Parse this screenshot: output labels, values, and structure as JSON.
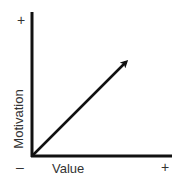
{
  "diagram": {
    "type": "axes-with-vector",
    "y_axis": {
      "label": "Motivation",
      "positive_sign": "+",
      "negative_sign": "–"
    },
    "x_axis": {
      "label": "Value",
      "positive_sign": "+"
    },
    "vector": {
      "from": "origin",
      "direction": "up-right",
      "meaning": "increase in value increases motivation"
    },
    "colors": {
      "axis": "#111111",
      "arrow": "#111111",
      "text": "#333333",
      "background": "#ffffff"
    }
  }
}
